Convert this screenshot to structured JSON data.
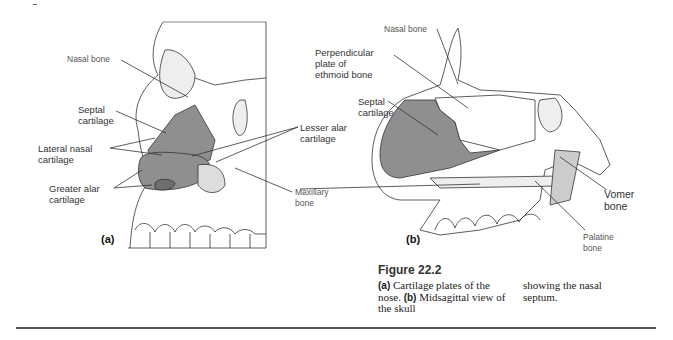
{
  "figure": {
    "number": "Figure 22.2",
    "panel_a": {
      "label": "(a)",
      "labels": {
        "nasal_bone": "Nasal bone",
        "septal_cartilage": [
          "Septal",
          "cartilage"
        ],
        "lateral_nasal_cartilage": [
          "Lateral nasal",
          "cartilage"
        ],
        "greater_alar_cartilage": [
          "Greater alar",
          "cartilage"
        ],
        "lesser_alar_cartilage": [
          "Lesser alar",
          "cartilage"
        ],
        "maxillary_bone": [
          "Maxillary",
          "bone"
        ]
      }
    },
    "panel_b": {
      "label": "(b)",
      "labels": {
        "nasal_bone": "Nasal bone",
        "perpendicular_plate": [
          "Perpendicular",
          "plate of",
          "ethmoid bone"
        ],
        "septal_cartilage": [
          "Septal",
          "cartilage"
        ],
        "vomer_bone": [
          "Vomer",
          "bone"
        ],
        "palatine_bone": [
          "Palatine",
          "bone"
        ]
      }
    },
    "caption": {
      "col1": {
        "a_marker": "(a)",
        "a_text": " Cartilage plates of the nose. ",
        "b_marker": "(b)",
        "b_text": " Midsagittal view of the skull"
      },
      "col2": "showing the nasal septum."
    }
  },
  "colors": {
    "cartilage_fill": "#8f8f8f",
    "line": "#333333",
    "rule": "#555555"
  }
}
